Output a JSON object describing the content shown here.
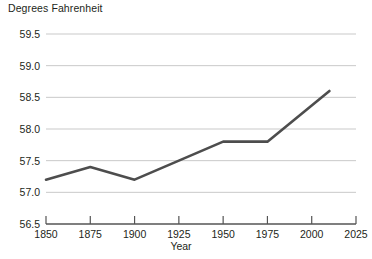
{
  "chart_data": {
    "type": "line",
    "title": "",
    "ylabel": "Degrees Fahrenheit",
    "xlabel": "Year",
    "x": [
      1850,
      1875,
      1900,
      1925,
      1950,
      1975,
      2010
    ],
    "values": [
      57.2,
      57.4,
      57.2,
      57.5,
      57.8,
      57.8,
      58.6
    ],
    "series": [
      {
        "name": "Global average temperature",
        "values": [
          57.2,
          57.4,
          57.2,
          57.5,
          57.8,
          57.8,
          58.6
        ]
      }
    ],
    "xlim": [
      1850,
      2025
    ],
    "ylim": [
      56.5,
      59.5
    ],
    "xticks": [
      1850,
      1875,
      1900,
      1925,
      1950,
      1975,
      2000,
      2025
    ],
    "xtick_labels": [
      "1850",
      "1875",
      "1900",
      "1925",
      "1950",
      "1975",
      "2000",
      "2025"
    ],
    "yticks": [
      56.5,
      57.0,
      57.5,
      58.0,
      58.5,
      59.0,
      59.5
    ],
    "ytick_labels": [
      "56.5",
      "57.0",
      "57.5",
      "58.0",
      "58.5",
      "59.0",
      "59.5"
    ],
    "grid": true,
    "grid_axis": "y",
    "legend": false,
    "legend_position": "none",
    "line_color": "#4d4d4d",
    "grid_color": "#c9c9c9",
    "axis_color": "#545454"
  }
}
